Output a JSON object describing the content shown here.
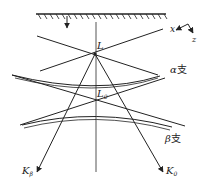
{
  "diagram": {
    "title": "",
    "labels": {
      "L": "L",
      "L0_base": "L",
      "L0_sub": "0",
      "x_axis": "x",
      "z_axis": "z",
      "alpha_branch_greek": "α",
      "alpha_branch_cjk": "支",
      "beta_branch_greek": "β",
      "beta_branch_cjk": "支",
      "K_beta_base": "K",
      "K_beta_sub": "β",
      "K0_base": "K",
      "K0_sub": "0"
    },
    "colors": {
      "stroke": "#222222",
      "background": "#ffffff"
    }
  }
}
